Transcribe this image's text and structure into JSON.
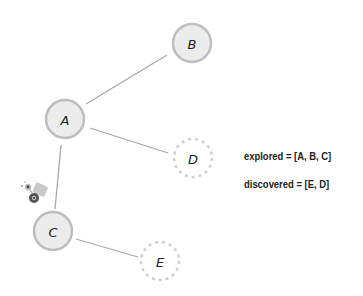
{
  "diagram": {
    "type": "graph-traversal",
    "nodes": [
      {
        "id": "A",
        "label": "A",
        "x": 65,
        "y": 119,
        "state": "explored"
      },
      {
        "id": "B",
        "label": "B",
        "x": 192,
        "y": 43,
        "state": "explored"
      },
      {
        "id": "C",
        "label": "C",
        "x": 53,
        "y": 231,
        "state": "explored"
      },
      {
        "id": "D",
        "label": "D",
        "x": 193,
        "y": 158,
        "state": "discovered"
      },
      {
        "id": "E",
        "label": "E",
        "x": 160,
        "y": 261,
        "state": "discovered"
      }
    ],
    "edges": [
      {
        "from": "A",
        "to": "B"
      },
      {
        "from": "A",
        "to": "D"
      },
      {
        "from": "A",
        "to": "C"
      },
      {
        "from": "C",
        "to": "E"
      }
    ],
    "colors": {
      "explored_fill": "#e9e9e9",
      "explored_stroke": "#bdbdbd",
      "discovered_stroke": "#cfcfcf",
      "edge": "#a8a8a8",
      "text": "#222222"
    },
    "crawler_icon": "spider-bot-icon"
  },
  "status": {
    "explored_text": "explored = [A, B, C]",
    "discovered_text": "discovered = [E, D]"
  }
}
